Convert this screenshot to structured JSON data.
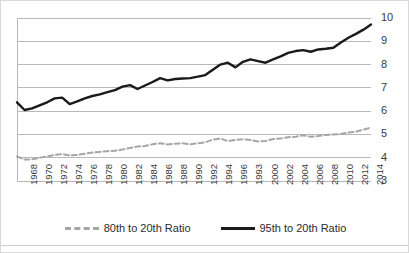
{
  "chart_data": {
    "type": "line",
    "title": "",
    "subtitle": "",
    "xlabel": "",
    "ylabel": "",
    "ylim": [
      3,
      10
    ],
    "yticks": [
      3,
      4,
      5,
      6,
      7,
      8,
      9,
      10
    ],
    "ytick_labels": [
      "3",
      "4",
      "5",
      "6",
      "7",
      "8",
      "9",
      "10"
    ],
    "grid": "horizontal",
    "legend_position": "bottom",
    "x_start": 1967,
    "x_end": 2014,
    "x": [
      1967,
      1968,
      1969,
      1970,
      1971,
      1972,
      1973,
      1974,
      1975,
      1976,
      1977,
      1978,
      1979,
      1980,
      1981,
      1982,
      1983,
      1984,
      1985,
      1986,
      1987,
      1988,
      1989,
      1990,
      1991,
      1992,
      1993,
      1994,
      1995,
      1996,
      1997,
      1998,
      1999,
      2000,
      2001,
      2002,
      2003,
      2004,
      2005,
      2006,
      2007,
      2008,
      2009,
      2010,
      2011,
      2012,
      2013,
      2014
    ],
    "xtick_labels": [
      "1968",
      "1970",
      "1972",
      "1974",
      "1976",
      "1978",
      "1980",
      "1982",
      "1984",
      "1986",
      "1988",
      "1990",
      "1992",
      "1994",
      "1996",
      "1993",
      "2000",
      "2002",
      "2004",
      "2006",
      "2008",
      "2010",
      "2012",
      "2014"
    ],
    "xtick_years": [
      1968,
      1970,
      1972,
      1974,
      1976,
      1978,
      1980,
      1982,
      1984,
      1986,
      1988,
      1990,
      1992,
      1994,
      1996,
      1998,
      2000,
      2002,
      2004,
      2006,
      2008,
      2010,
      2012,
      2014
    ],
    "series": [
      {
        "name": "80th to 20th Ratio",
        "color": "#a6a6a6",
        "style": "dashed",
        "values": [
          4.05,
          3.92,
          3.93,
          4.0,
          4.05,
          4.12,
          4.15,
          4.1,
          4.12,
          4.17,
          4.22,
          4.25,
          4.28,
          4.3,
          4.35,
          4.42,
          4.48,
          4.5,
          4.58,
          4.62,
          4.57,
          4.6,
          4.62,
          4.58,
          4.62,
          4.66,
          4.78,
          4.82,
          4.72,
          4.76,
          4.8,
          4.76,
          4.7,
          4.72,
          4.8,
          4.82,
          4.88,
          4.9,
          4.96,
          4.9,
          4.93,
          4.98,
          5.0,
          5.02,
          5.08,
          5.12,
          5.2,
          5.3
        ]
      },
      {
        "name": "95th to 20th Ratio",
        "color": "#1a1a1a",
        "style": "solid",
        "values": [
          6.38,
          6.05,
          6.12,
          6.25,
          6.38,
          6.55,
          6.58,
          6.3,
          6.42,
          6.55,
          6.65,
          6.72,
          6.82,
          6.9,
          7.05,
          7.12,
          6.95,
          7.1,
          7.25,
          7.42,
          7.32,
          7.38,
          7.4,
          7.42,
          7.48,
          7.55,
          7.78,
          8.0,
          8.08,
          7.88,
          8.12,
          8.22,
          8.15,
          8.08,
          8.22,
          8.35,
          8.5,
          8.58,
          8.62,
          8.55,
          8.65,
          8.68,
          8.72,
          8.95,
          9.15,
          9.32,
          9.5,
          9.72
        ]
      }
    ]
  },
  "legend": {
    "items": [
      {
        "label": "80th to 20th Ratio"
      },
      {
        "label": "95th to 20th Ratio"
      }
    ]
  }
}
